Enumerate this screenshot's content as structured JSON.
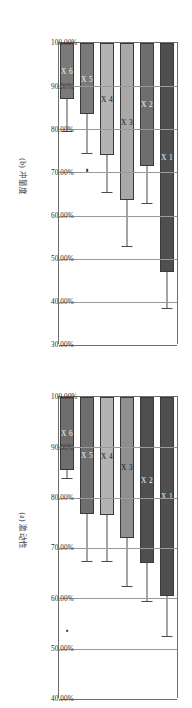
{
  "figure": {
    "orientation": "rotated-90",
    "panels": [
      {
        "id": "panel-a",
        "caption": "(a) 激动性",
        "chart_data": {
          "type": "bar",
          "title": "(a) 激动性",
          "orientation": "horizontal",
          "xlabel": "",
          "ylabel": "",
          "grid": true,
          "legend": "none",
          "xlim": [
            40,
            100
          ],
          "tick_labels": [
            "100.00%",
            "90.00%",
            "80.00%",
            "70.00%",
            "60.00%",
            "50.00%",
            "40.00%"
          ],
          "tick_values": [
            100,
            90,
            80,
            70,
            60,
            50,
            40
          ],
          "categories": [
            "X 1",
            "X 2",
            "X 3",
            "X 4",
            "X 5",
            "X 6"
          ],
          "values": [
            60.5,
            67.0,
            72.0,
            76.5,
            76.8,
            85.5
          ],
          "err_low": [
            52.5,
            59.5,
            62.5,
            67.5,
            67.5,
            84.0
          ],
          "err_high": [
            100.0,
            100.0,
            82.0,
            100.0,
            100.0,
            93.5
          ],
          "bar_colors": [
            "#4f4f4f",
            "#4f4f4f",
            "#8f8f8f",
            "#b3b3b3",
            "#6e6e6e",
            "#6e6e6e"
          ],
          "outliers": [
            {
              "category": "X 6",
              "value": 53.5
            }
          ]
        }
      },
      {
        "id": "panel-b",
        "caption": "(b) 冲量度",
        "chart_data": {
          "type": "bar",
          "title": "(b) 冲量度",
          "orientation": "horizontal",
          "xlabel": "",
          "ylabel": "",
          "grid": true,
          "legend": "none",
          "xlim": [
            30,
            100
          ],
          "tick_labels": [
            "100.00%",
            "90.00%",
            "80.00%",
            "70.00%",
            "60.00%",
            "50.00%",
            "40.00%",
            "30.00%"
          ],
          "tick_values": [
            100,
            90,
            80,
            70,
            60,
            50,
            40,
            30
          ],
          "categories": [
            "X 1",
            "X 2",
            "X 3",
            "X 4",
            "X 5",
            "X 6"
          ],
          "values": [
            47.0,
            71.5,
            63.5,
            74.0,
            83.5,
            87.0
          ],
          "err_low": [
            38.5,
            63.0,
            53.0,
            65.5,
            74.5,
            79.5
          ],
          "err_high": [
            100.0,
            100.0,
            89.5,
            100.0,
            100.0,
            100.0
          ],
          "bar_colors": [
            "#4f4f4f",
            "#6e6e6e",
            "#a8a8a8",
            "#b3b3b3",
            "#7a7a7a",
            "#7a7a7a"
          ],
          "outliers": [
            {
              "category": "X 5",
              "value": 70.5
            }
          ]
        }
      }
    ]
  },
  "colors": {
    "axis": "#6d6d6d",
    "grid": "#9a9a9a",
    "error": "#4a4a4a",
    "text": "#2a2a2a",
    "caption": "#3c3c3c",
    "background": "#ffffff"
  }
}
